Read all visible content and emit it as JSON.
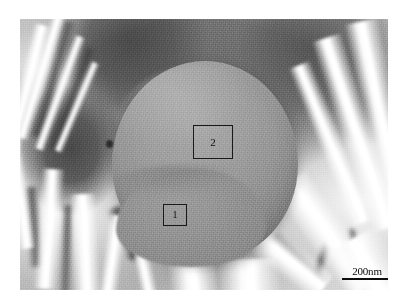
{
  "figure": {
    "kind": "sem-micrograph",
    "background_color": "#ffffff",
    "matrix_color": "#9a9a9a",
    "crystal_color": "#ffffff",
    "void_color": "#4f4f4f"
  },
  "micrograph": {
    "particle": {
      "name": "spherical-particle",
      "fill_color": "#a0a0a0"
    },
    "analysis_regions": [
      {
        "id": "1",
        "label": "1",
        "name": "analysis-box-1"
      },
      {
        "id": "2",
        "label": "2",
        "name": "analysis-box-2"
      }
    ],
    "scale_bar": {
      "label": "200nm",
      "value": "200",
      "unit": "nm",
      "color": "#111111"
    }
  }
}
